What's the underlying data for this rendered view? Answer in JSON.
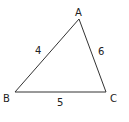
{
  "diagram": {
    "type": "triangle",
    "vertices": [
      {
        "name": "A",
        "x": 79,
        "y": 19,
        "label_x": 75,
        "label_y": 16
      },
      {
        "name": "B",
        "x": 15,
        "y": 92,
        "label_x": 3,
        "label_y": 102
      },
      {
        "name": "C",
        "x": 106,
        "y": 92,
        "label_x": 110,
        "label_y": 102
      }
    ],
    "sides": [
      {
        "between": "AB",
        "length": "4",
        "label_x": 35,
        "label_y": 54
      },
      {
        "between": "AC",
        "length": "6",
        "label_x": 98,
        "label_y": 55
      },
      {
        "between": "BC",
        "length": "5",
        "label_x": 57,
        "label_y": 106
      }
    ],
    "stroke_color": "#333333"
  }
}
